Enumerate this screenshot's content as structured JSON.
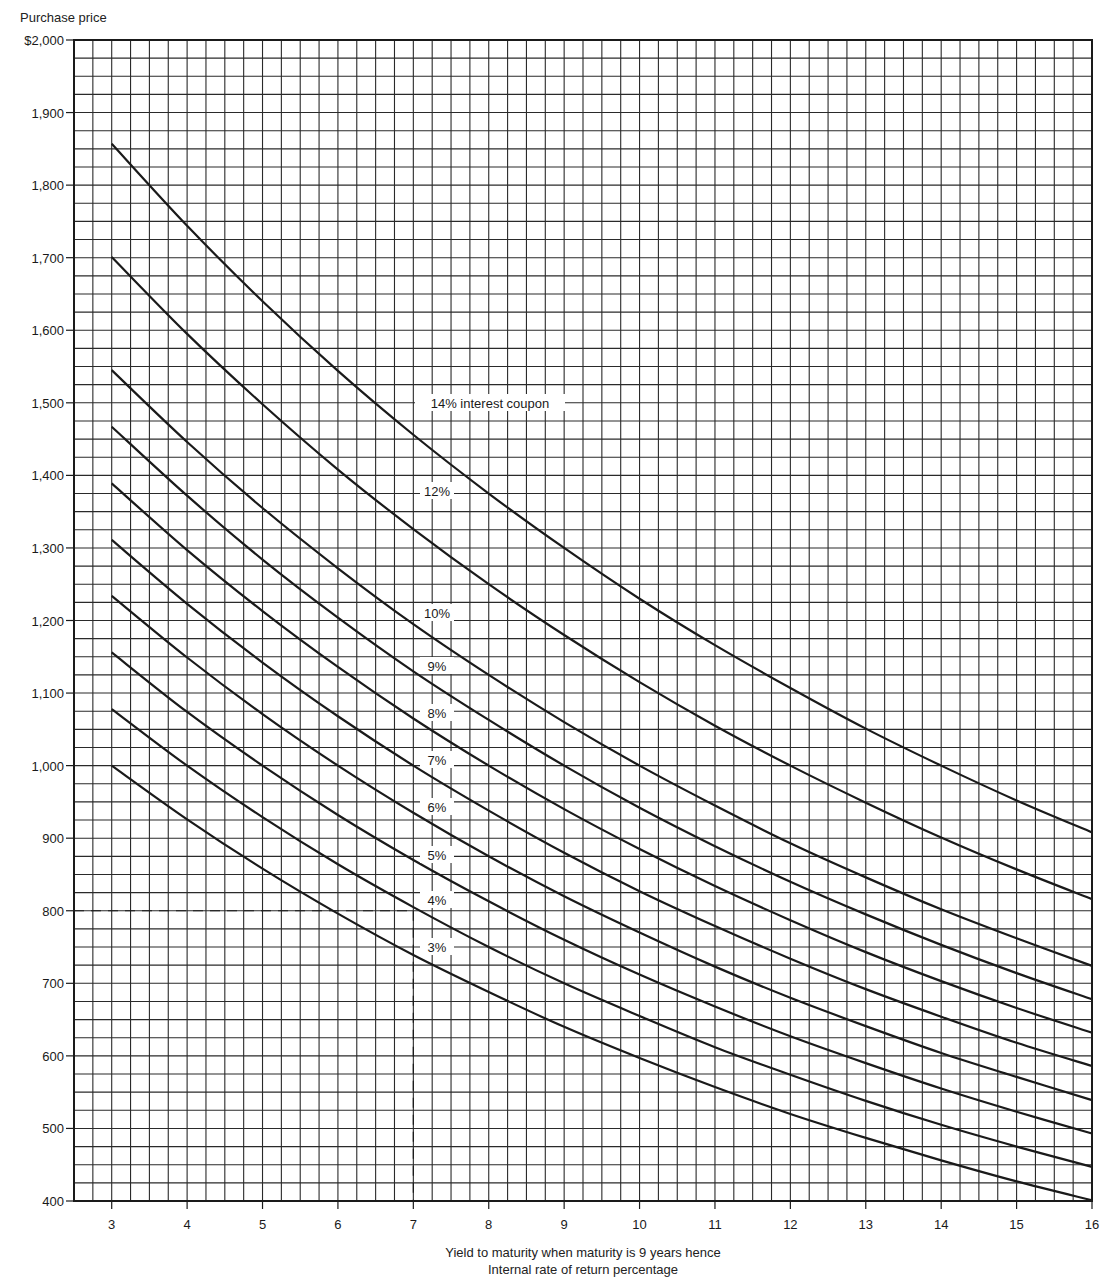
{
  "chart_data": {
    "type": "line",
    "title": "",
    "ylabel": "Purchase price",
    "xlabel": "Yield to maturity when maturity is 9 years hence",
    "xlabel_sub": "Internal rate of return percentage",
    "xlim": [
      2.5,
      16
    ],
    "ylim": [
      400,
      2000
    ],
    "grid": true,
    "x_ticks": [
      3,
      4,
      5,
      6,
      7,
      8,
      9,
      10,
      11,
      12,
      13,
      14,
      15,
      16
    ],
    "y_ticks": [
      {
        "value": 2000,
        "label": "$2,000"
      },
      {
        "value": 1900,
        "label": "1,900"
      },
      {
        "value": 1800,
        "label": "1,800"
      },
      {
        "value": 1700,
        "label": "1,700"
      },
      {
        "value": 1600,
        "label": "1,600"
      },
      {
        "value": 1500,
        "label": "1,500"
      },
      {
        "value": 1400,
        "label": "1,400"
      },
      {
        "value": 1300,
        "label": "1,300"
      },
      {
        "value": 1200,
        "label": "1,200"
      },
      {
        "value": 1100,
        "label": "1,100"
      },
      {
        "value": 1000,
        "label": "1,000"
      },
      {
        "value": 900,
        "label": "900"
      },
      {
        "value": 800,
        "label": "800"
      },
      {
        "value": 700,
        "label": "700"
      },
      {
        "value": 600,
        "label": "600"
      },
      {
        "value": 500,
        "label": "500"
      },
      {
        "value": 400,
        "label": "400"
      }
    ],
    "x": [
      3,
      4,
      5,
      6,
      7,
      8,
      9,
      10,
      11,
      12,
      13,
      14,
      15,
      16
    ],
    "series": [
      {
        "name": "14% interest coupon",
        "label": "14% interest coupon",
        "label_y": 1500,
        "values": [
          1857,
          1744,
          1640,
          1544,
          1456,
          1375,
          1300,
          1230,
          1166,
          1107,
          1051,
          1000,
          952,
          908
        ]
      },
      {
        "name": "12%",
        "label": "12%",
        "label_y": 1378,
        "values": [
          1701,
          1595,
          1498,
          1408,
          1326,
          1250,
          1180,
          1115,
          1055,
          1000,
          949,
          901,
          857,
          816
        ]
      },
      {
        "name": "10%",
        "label": "10%",
        "label_y": 1210,
        "values": [
          1545,
          1446,
          1355,
          1272,
          1195,
          1125,
          1060,
          1000,
          945,
          893,
          846,
          802,
          762,
          724
        ]
      },
      {
        "name": "9%",
        "label": "9%",
        "label_y": 1137,
        "values": [
          1467,
          1372,
          1284,
          1204,
          1130,
          1063,
          1000,
          942,
          889,
          840,
          795,
          753,
          714,
          678
        ]
      },
      {
        "name": "8%",
        "label": "8%",
        "label_y": 1072,
        "values": [
          1389,
          1297,
          1213,
          1136,
          1065,
          1000,
          940,
          885,
          834,
          787,
          743,
          703,
          666,
          632
        ]
      },
      {
        "name": "7%",
        "label": "7%",
        "label_y": 1007,
        "values": [
          1311,
          1223,
          1142,
          1068,
          1000,
          938,
          880,
          827,
          779,
          734,
          692,
          654,
          618,
          586
        ]
      },
      {
        "name": "6%",
        "label": "6%",
        "label_y": 942,
        "values": [
          1234,
          1149,
          1071,
          1000,
          935,
          875,
          820,
          770,
          723,
          680,
          641,
          604,
          571,
          539
        ]
      },
      {
        "name": "5%",
        "label": "5%",
        "label_y": 876,
        "values": [
          1156,
          1074,
          1000,
          932,
          870,
          813,
          760,
          712,
          668,
          627,
          590,
          555,
          523,
          493
        ]
      },
      {
        "name": "4%",
        "label": "4%",
        "label_y": 814,
        "values": [
          1078,
          1000,
          929,
          864,
          805,
          750,
          700,
          655,
          612,
          574,
          538,
          505,
          475,
          447
        ]
      },
      {
        "name": "3%",
        "label": "3%",
        "label_y": 349,
        "values": [
          1000,
          926,
          858,
          796,
          739,
          688,
          640,
          597,
          557,
          520,
          487,
          456,
          427,
          401
        ]
      }
    ],
    "annotations": [
      {
        "type": "dashed-reference",
        "x": 7,
        "y": 800,
        "description": "Dashed line from $800 to 7% yield on 4% coupon curve"
      }
    ]
  },
  "labels": {
    "y_title": "Purchase price",
    "x_title": "Yield to maturity when maturity is 9 years hence",
    "x_subtitle": "Internal rate of return percentage"
  },
  "colors": {
    "ink": "#1a1a1a",
    "grid": "#2a2a2a",
    "background": "#ffffff"
  }
}
